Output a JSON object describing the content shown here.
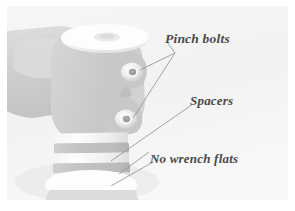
{
  "figure": {
    "background_color": "#ffffff",
    "plate_color": "#f2f3f2"
  },
  "annotations": {
    "labels": [
      {
        "id": "pinch-bolts",
        "text": "Pinch bolts",
        "color": "#4a4a4c"
      },
      {
        "id": "spacers",
        "text": "Spacers",
        "color": "#4a4a4c"
      },
      {
        "id": "no-wrench-flats",
        "text": "No wrench flats",
        "color": "#4a4a4c"
      }
    ],
    "leader_line_color": "#8f9093"
  },
  "part_colors": {
    "stem_body": "#cfd0cf",
    "stem_body_light": "#dcdddb",
    "stem_shadow": "#bcbdbc",
    "top_cap": "#fbfbfa",
    "spacer_light": "#fafaf9",
    "spacer_dark": "#c9cac8",
    "bolt_ring": "#f4f4f2",
    "bolt_core": "#a9aaa9",
    "steerer": "#e2e3e1"
  }
}
